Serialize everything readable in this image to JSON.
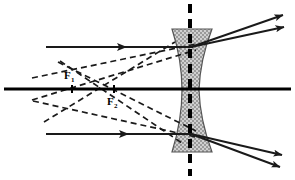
{
  "figure": {
    "type": "optics-ray-diagram",
    "width": 295,
    "height": 180,
    "background_color": "#ffffff"
  },
  "colors": {
    "ray_stroke": "#1a1a1a",
    "axis_stroke": "#000000",
    "lens_fill": "#b8b8b8",
    "lens_outline": "#555555",
    "label_color": "#000000"
  },
  "labels": {
    "focal_near": {
      "text": "F",
      "subscript": "1",
      "x": 68,
      "y": 76
    },
    "focal_far": {
      "text": "F",
      "subscript": "2",
      "x": 110,
      "y": 104
    }
  },
  "optical_axis": {
    "name": "optical-axis",
    "x1": 4,
    "y1": 89,
    "x2": 291,
    "y2": 89,
    "style": "solid"
  },
  "lens_axis": {
    "name": "lens-principal-axis",
    "x1": 190,
    "y1": 4,
    "x2": 190,
    "y2": 176,
    "style": "dashed-vertical"
  },
  "lens": {
    "name": "biconcave-diverging-lens",
    "kind": "biconcave",
    "top_y": 29,
    "bottom_y": 152,
    "center_y": 90,
    "left_top_x": 172,
    "right_top_x": 212,
    "left_waist_x": 182,
    "right_waist_x": 199,
    "fill_pattern": "stipple-gray"
  },
  "focal_points": [
    {
      "name": "F1",
      "x": 72,
      "y": 89
    },
    {
      "name": "F2",
      "x": 114,
      "y": 89
    }
  ],
  "rays": {
    "incident": [
      {
        "name": "incident-ray-upper",
        "style": "solid",
        "x1": 46,
        "y1": 47,
        "x2": 193,
        "y2": 47,
        "arrow_at": 0.55,
        "description": "upper parallel ray travelling right toward lens"
      },
      {
        "name": "incident-ray-lower",
        "style": "solid",
        "x1": 46,
        "y1": 134,
        "x2": 192,
        "y2": 134,
        "arrow_at": 0.55,
        "description": "lower parallel ray travelling right toward lens"
      }
    ],
    "refracted": [
      {
        "name": "refracted-ray-upper-a",
        "style": "solid",
        "x1": 191,
        "y1": 47,
        "x2": 287,
        "y2": 14,
        "arrow_at": 1.0
      },
      {
        "name": "refracted-ray-upper-b",
        "style": "solid",
        "x1": 191,
        "y1": 47,
        "x2": 288,
        "y2": 26,
        "arrow_at": 1.0
      },
      {
        "name": "refracted-ray-lower-a",
        "style": "solid",
        "x1": 191,
        "y1": 134,
        "x2": 286,
        "y2": 156,
        "arrow_at": 1.0
      },
      {
        "name": "refracted-ray-lower-b",
        "style": "solid",
        "x1": 191,
        "y1": 134,
        "x2": 284,
        "y2": 169,
        "arrow_at": 1.0
      }
    ],
    "virtual": [
      {
        "name": "virtual-extension-upper-to-F1",
        "style": "dashed",
        "x1": 32,
        "y1": 78,
        "x2": 196,
        "y2": 44,
        "description": "backward extension of upper refracted ray through F1"
      },
      {
        "name": "virtual-extension-upper-to-F2",
        "style": "dashed",
        "x1": 32,
        "y1": 100,
        "x2": 196,
        "y2": 50,
        "description": "backward extension through F2"
      },
      {
        "name": "virtual-extension-lower-to-F1",
        "style": "dashed",
        "x1": 33,
        "y1": 101,
        "x2": 196,
        "y2": 137,
        "description": "backward extension of lower refracted ray through F1"
      },
      {
        "name": "virtual-extension-lower-to-F2",
        "style": "dashed",
        "x1": 58,
        "y1": 62,
        "x2": 196,
        "y2": 131,
        "description": "backward extension through F2"
      },
      {
        "name": "virtual-construction-upper-left",
        "style": "dashed",
        "x1": 60,
        "y1": 61,
        "x2": 182,
        "y2": 143,
        "description": "auxiliary construction line"
      },
      {
        "name": "virtual-construction-lower-left",
        "style": "dashed",
        "x1": 44,
        "y1": 122,
        "x2": 175,
        "y2": 42,
        "description": "auxiliary construction line"
      }
    ]
  }
}
